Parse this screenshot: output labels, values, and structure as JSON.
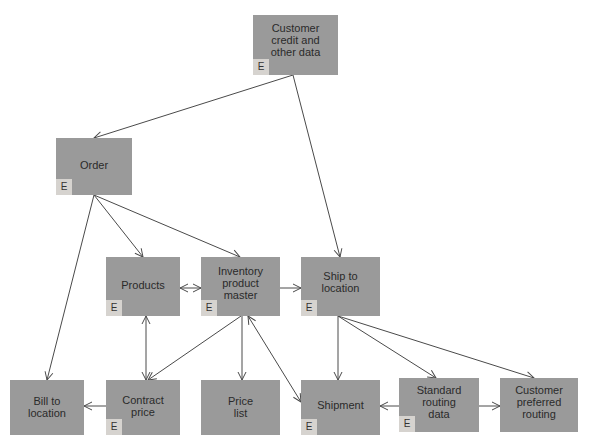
{
  "diagram": {
    "type": "entity-relationship",
    "colors": {
      "box": "#9a9a9a",
      "badge": "#d6d3cf",
      "line": "#4a4a4a",
      "text": "#2a2a2a"
    },
    "badge_label": "E",
    "nodes": {
      "customer_credit": {
        "label": "Customer\ncredit and\nother data",
        "entity": true
      },
      "order": {
        "label": "Order",
        "entity": true
      },
      "products": {
        "label": "Products",
        "entity": true
      },
      "inventory": {
        "label": "Inventory\nproduct\nmaster",
        "entity": true
      },
      "ship_to": {
        "label": "Ship to\nlocation",
        "entity": true
      },
      "bill_to": {
        "label": "Bill to\nlocation",
        "entity": false
      },
      "contract_price": {
        "label": "Contract\nprice",
        "entity": true
      },
      "price_list": {
        "label": "Price\nlist",
        "entity": false
      },
      "shipment": {
        "label": "Shipment",
        "entity": true
      },
      "standard_routing": {
        "label": "Standard\nrouting\ndata",
        "entity": true
      },
      "customer_preferred": {
        "label": "Customer\npreferred\nrouting",
        "entity": false
      }
    },
    "edges": [
      {
        "from": "customer_credit",
        "to": "order"
      },
      {
        "from": "customer_credit",
        "to": "ship_to"
      },
      {
        "from": "order",
        "to": "products"
      },
      {
        "from": "order",
        "to": "inventory"
      },
      {
        "from": "order",
        "to": "bill_to"
      },
      {
        "from": "products",
        "to": "inventory",
        "bidirectional": true
      },
      {
        "from": "inventory",
        "to": "ship_to"
      },
      {
        "from": "contract_price",
        "to": "products",
        "bidirectional": true
      },
      {
        "from": "inventory",
        "to": "contract_price"
      },
      {
        "from": "inventory",
        "to": "price_list"
      },
      {
        "from": "shipment",
        "to": "inventory",
        "bidirectional": true
      },
      {
        "from": "contract_price",
        "to": "bill_to"
      },
      {
        "from": "ship_to",
        "to": "shipment"
      },
      {
        "from": "ship_to",
        "to": "standard_routing"
      },
      {
        "from": "ship_to",
        "to": "customer_preferred"
      },
      {
        "from": "standard_routing",
        "to": "shipment"
      },
      {
        "from": "standard_routing",
        "to": "customer_preferred"
      }
    ]
  }
}
